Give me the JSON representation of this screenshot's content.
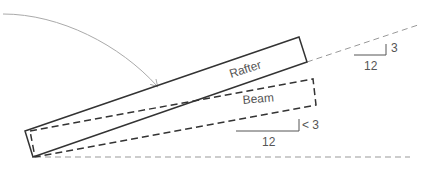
{
  "diagram": {
    "labels": {
      "rafter": "Rafter",
      "beam": "Beam"
    },
    "pitch_upper": {
      "rise": "3",
      "run": "12"
    },
    "pitch_lower": {
      "rise": "< 3",
      "run": "12"
    },
    "colors": {
      "solid_line": "#333333",
      "dashed_line": "#333333",
      "reference_dash": "#999999",
      "arrow": "#aaaaaa",
      "text": "#555555"
    }
  }
}
